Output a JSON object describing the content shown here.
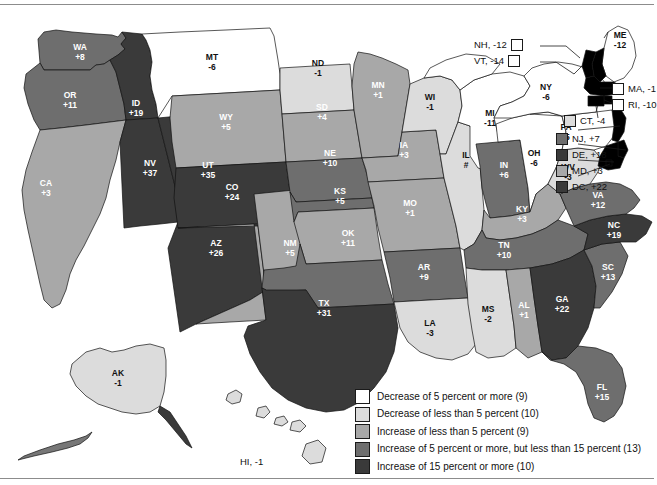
{
  "figure": {
    "type": "choropleth-map"
  },
  "legend": {
    "items": [
      {
        "label": "Decrease of 5 percent or more (9)",
        "color": "#ffffff",
        "count": 9,
        "class": "d5plus"
      },
      {
        "label": "Decrease of less than 5 percent (10)",
        "color": "#dcdcdc",
        "count": 10,
        "class": "d5less"
      },
      {
        "label": "Increase of less than 5 percent (9)",
        "color": "#a8a8a8",
        "count": 9,
        "class": "i5less"
      },
      {
        "label": "Increase of 5 percent or more, but less than 15 percent (13)",
        "color": "#6e6e6e",
        "count": 13,
        "class": "i5to15"
      },
      {
        "label": "Increase of 15 percent or more (10)",
        "color": "#3a3a3a",
        "count": 10,
        "class": "i15plus"
      }
    ]
  },
  "states": {
    "WA": {
      "abbr": "WA",
      "value": "+8",
      "color": "#6e6e6e",
      "text": "light"
    },
    "OR": {
      "abbr": "OR",
      "value": "+11",
      "color": "#6e6e6e",
      "text": "light"
    },
    "CA": {
      "abbr": "CA",
      "value": "+3",
      "color": "#a8a8a8",
      "text": "light"
    },
    "ID": {
      "abbr": "ID",
      "value": "+19",
      "color": "#3a3a3a",
      "text": "light"
    },
    "NV": {
      "abbr": "NV",
      "value": "+37",
      "color": "#3a3a3a",
      "text": "light"
    },
    "UT": {
      "abbr": "UT",
      "value": "+35",
      "color": "#3a3a3a",
      "text": "light"
    },
    "AZ": {
      "abbr": "AZ",
      "value": "+26",
      "color": "#3a3a3a",
      "text": "light"
    },
    "MT": {
      "abbr": "MT",
      "value": "-6",
      "color": "#ffffff",
      "text": "dark"
    },
    "WY": {
      "abbr": "WY",
      "value": "+5",
      "color": "#a8a8a8",
      "text": "light"
    },
    "CO": {
      "abbr": "CO",
      "value": "+24",
      "color": "#3a3a3a",
      "text": "light"
    },
    "NM": {
      "abbr": "NM",
      "value": "+5",
      "color": "#a8a8a8",
      "text": "light"
    },
    "ND": {
      "abbr": "ND",
      "value": "-1",
      "color": "#dcdcdc",
      "text": "dark"
    },
    "SD": {
      "abbr": "SD",
      "value": "+4",
      "color": "#a8a8a8",
      "text": "light"
    },
    "NE": {
      "abbr": "NE",
      "value": "+10",
      "color": "#6e6e6e",
      "text": "light"
    },
    "KS": {
      "abbr": "KS",
      "value": "+5",
      "color": "#a8a8a8",
      "text": "light"
    },
    "OK": {
      "abbr": "OK",
      "value": "+11",
      "color": "#6e6e6e",
      "text": "light"
    },
    "TX": {
      "abbr": "TX",
      "value": "+31",
      "color": "#3a3a3a",
      "text": "light"
    },
    "MN": {
      "abbr": "MN",
      "value": "+1",
      "color": "#a8a8a8",
      "text": "light"
    },
    "IA": {
      "abbr": "IA",
      "value": "+3",
      "color": "#a8a8a8",
      "text": "light"
    },
    "MO": {
      "abbr": "MO",
      "value": "+1",
      "color": "#a8a8a8",
      "text": "light"
    },
    "AR": {
      "abbr": "AR",
      "value": "+9",
      "color": "#6e6e6e",
      "text": "light"
    },
    "LA": {
      "abbr": "LA",
      "value": "-3",
      "color": "#dcdcdc",
      "text": "dark"
    },
    "WI": {
      "abbr": "WI",
      "value": "-1",
      "color": "#dcdcdc",
      "text": "dark"
    },
    "IL": {
      "abbr": "IL",
      "value": "#",
      "color": "#dcdcdc",
      "text": "dark"
    },
    "MI": {
      "abbr": "MI",
      "value": "-11",
      "color": "#ffffff",
      "text": "dark"
    },
    "IN": {
      "abbr": "IN",
      "value": "+6",
      "color": "#6e6e6e",
      "text": "light"
    },
    "OH": {
      "abbr": "OH",
      "value": "-6",
      "color": "#ffffff",
      "text": "dark"
    },
    "KY": {
      "abbr": "KY",
      "value": "+3",
      "color": "#a8a8a8",
      "text": "light"
    },
    "TN": {
      "abbr": "TN",
      "value": "+10",
      "color": "#6e6e6e",
      "text": "light"
    },
    "MS": {
      "abbr": "MS",
      "value": "-2",
      "color": "#dcdcdc",
      "text": "dark"
    },
    "AL": {
      "abbr": "AL",
      "value": "+1",
      "color": "#a8a8a8",
      "text": "light"
    },
    "GA": {
      "abbr": "GA",
      "value": "+22",
      "color": "#3a3a3a",
      "text": "light"
    },
    "FL": {
      "abbr": "FL",
      "value": "+15",
      "color": "#6e6e6e",
      "text": "light"
    },
    "SC": {
      "abbr": "SC",
      "value": "+13",
      "color": "#6e6e6e",
      "text": "light"
    },
    "NC": {
      "abbr": "NC",
      "value": "+19",
      "color": "#3a3a3a",
      "text": "light"
    },
    "VA": {
      "abbr": "VA",
      "value": "+12",
      "color": "#6e6e6e",
      "text": "light"
    },
    "WV": {
      "abbr": "WV",
      "value": "-3",
      "color": "#dcdcdc",
      "text": "dark"
    },
    "PA": {
      "abbr": "PA",
      "value": "-5",
      "color": "#ffffff",
      "text": "dark"
    },
    "NY": {
      "abbr": "NY",
      "value": "-6",
      "color": "#ffffff",
      "text": "dark"
    },
    "ME": {
      "abbr": "ME",
      "value": "-12",
      "color": "#ffffff",
      "text": "dark"
    },
    "AK": {
      "abbr": "AK",
      "value": "-1",
      "color": "#dcdcdc",
      "text": "dark"
    }
  },
  "callouts": [
    {
      "id": "NH",
      "label": "NH, -12",
      "color": "#ffffff"
    },
    {
      "id": "VT",
      "label": "VT, -14",
      "color": "#ffffff"
    },
    {
      "id": "MA",
      "label": "MA, -1",
      "color": "#ffffff"
    },
    {
      "id": "RI",
      "label": "RI, -10",
      "color": "#ffffff"
    },
    {
      "id": "CT",
      "label": "CT, -4",
      "color": "#dcdcdc"
    },
    {
      "id": "NJ",
      "label": "NJ, +7",
      "color": "#6e6e6e"
    },
    {
      "id": "DE",
      "label": "DE, +18",
      "color": "#3a3a3a"
    },
    {
      "id": "MD",
      "label": "MD, +3",
      "color": "#a8a8a8"
    },
    {
      "id": "DC",
      "label": "DC, +22",
      "color": "#3a3a3a"
    }
  ],
  "inset": {
    "hawaii_label": "HI, -1"
  }
}
